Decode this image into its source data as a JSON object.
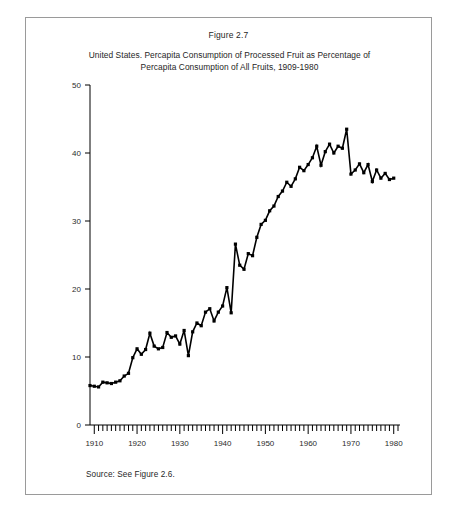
{
  "figure": {
    "number": "Figure 2.7",
    "title_line1": "United States. Percapita Consumption of Processed Fruit as Percentage of",
    "title_line2": "Percapita Consumption of All Fruits, 1909-1980",
    "source": "Source: See Figure 2.6."
  },
  "chart_data": {
    "type": "line",
    "title": "United States. Percapita Consumption of Processed Fruit as Percentage of Percapita Consumption of All Fruits, 1909-1980",
    "xlabel": "",
    "ylabel": "",
    "xlim": [
      1909,
      1981
    ],
    "ylim": [
      0,
      50
    ],
    "yticks": [
      0,
      10,
      20,
      30,
      40,
      50
    ],
    "ytick_labels": [
      "0",
      "10",
      "20",
      "30",
      "40",
      "50"
    ],
    "xticks": [
      1910,
      1920,
      1930,
      1940,
      1950,
      1960,
      1970,
      1980
    ],
    "xtick_labels": [
      "1910",
      "1920",
      "1930",
      "1940",
      "1950",
      "1960",
      "1970",
      "1980"
    ],
    "minor_xtick_interval": 1,
    "grid": false,
    "legend": null,
    "marker": "square",
    "line_color": "#000000",
    "marker_color": "#000000",
    "x": [
      1909,
      1910,
      1911,
      1912,
      1913,
      1914,
      1915,
      1916,
      1917,
      1918,
      1919,
      1920,
      1921,
      1922,
      1923,
      1924,
      1925,
      1926,
      1927,
      1928,
      1929,
      1930,
      1931,
      1932,
      1933,
      1934,
      1935,
      1936,
      1937,
      1938,
      1939,
      1940,
      1941,
      1942,
      1943,
      1944,
      1945,
      1946,
      1947,
      1948,
      1949,
      1950,
      1951,
      1952,
      1953,
      1954,
      1955,
      1956,
      1957,
      1958,
      1959,
      1960,
      1961,
      1962,
      1963,
      1964,
      1965,
      1966,
      1967,
      1968,
      1969,
      1970,
      1971,
      1972,
      1973,
      1974,
      1975,
      1976,
      1977,
      1978,
      1979,
      1980
    ],
    "values": [
      5.8,
      5.7,
      5.6,
      6.3,
      6.2,
      6.1,
      6.3,
      6.5,
      7.2,
      7.6,
      9.9,
      11.2,
      10.4,
      11.1,
      13.5,
      11.6,
      11.2,
      11.4,
      13.6,
      12.9,
      13.1,
      11.9,
      13.9,
      10.2,
      13.7,
      15.0,
      14.6,
      16.6,
      17.1,
      15.3,
      16.6,
      17.5,
      20.2,
      16.5,
      26.6,
      23.5,
      22.9,
      25.2,
      24.9,
      27.6,
      29.5,
      30.1,
      31.5,
      32.2,
      33.6,
      34.4,
      35.7,
      35.1,
      36.2,
      37.9,
      37.4,
      38.3,
      39.3,
      41.0,
      38.2,
      40.2,
      41.3,
      40.0,
      41.0,
      40.7,
      43.5,
      36.9,
      37.5,
      38.4,
      37.1,
      38.3,
      35.8,
      37.5,
      36.3,
      37.0,
      36.1,
      36.3
    ]
  }
}
